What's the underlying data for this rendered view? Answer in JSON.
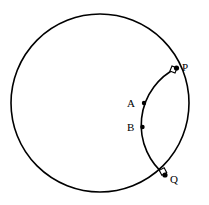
{
  "figure": {
    "type": "geometry-diagram",
    "background_color": "#ffffff",
    "stroke_color": "#000000",
    "width": 209,
    "height": 205
  },
  "shapes": {
    "main_circle": {
      "name": "main-circle",
      "center_x": 100,
      "center_y": 103,
      "radius": 89,
      "stroke_width": 1.6,
      "fill": "none"
    },
    "orthogonal_arc": {
      "name": "orthogonal-arc",
      "start_x": 176.5,
      "start_y": 68,
      "end_x": 165,
      "end_y": 175,
      "radius": 64,
      "large_arc": 0,
      "sweep": 0,
      "stroke_width": 1.6,
      "fill": "none"
    }
  },
  "points": [
    {
      "id": "P",
      "label": "P",
      "x": 176.5,
      "y": 68,
      "label_x": 182,
      "label_y": 62,
      "marker": "right-angle-square",
      "dot_radius": 2.6
    },
    {
      "id": "Q",
      "label": "Q",
      "x": 165,
      "y": 175,
      "label_x": 170,
      "label_y": 174,
      "marker": "right-angle-square",
      "dot_radius": 2.6
    },
    {
      "id": "A",
      "label": "A",
      "x": 144,
      "y": 103,
      "label_x": 127,
      "label_y": 98,
      "marker": "dot",
      "dot_radius": 2.2
    },
    {
      "id": "B",
      "label": "B",
      "x": 142.5,
      "y": 127,
      "label_x": 127,
      "label_y": 122,
      "marker": "dot",
      "dot_radius": 2.2
    }
  ],
  "right_angle_markers": [
    {
      "at_point": "P",
      "size": 5.5,
      "rotation": 22,
      "center_x": 173.5,
      "center_y": 69.5
    },
    {
      "at_point": "Q",
      "size": 5.5,
      "rotation": -28,
      "center_x": 163,
      "center_y": 171.5
    }
  ]
}
